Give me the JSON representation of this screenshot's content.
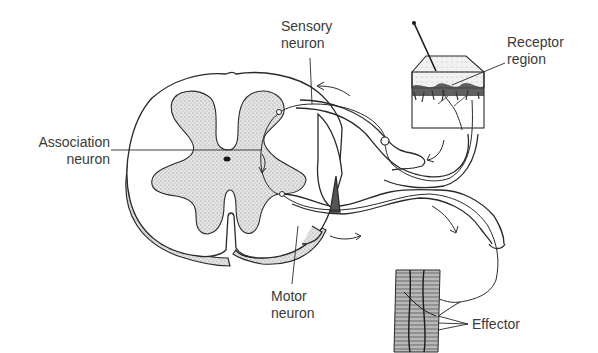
{
  "diagram": {
    "type": "reflex-arc",
    "colors": {
      "line": "#2a2a2a",
      "stipple": "#bdbdbd",
      "background": "#ffffff",
      "text": "#3a3a3a"
    }
  },
  "labels": {
    "association_neuron": {
      "line1": "Association",
      "line2": "neuron"
    },
    "sensory_neuron": {
      "line1": "Sensory",
      "line2": "neuron"
    },
    "receptor_region": {
      "line1": "Receptor",
      "line2": "region"
    },
    "motor_neuron": {
      "line1": "Motor",
      "line2": "neuron"
    },
    "effector": {
      "line1": "Effector"
    }
  },
  "parts": [
    "spinal-cord-cross-section",
    "gray-matter",
    "central-canal",
    "dorsal-root",
    "dorsal-root-ganglion",
    "ventral-root",
    "spinal-nerve",
    "skin-receptor-block",
    "pin",
    "muscle-effector"
  ]
}
